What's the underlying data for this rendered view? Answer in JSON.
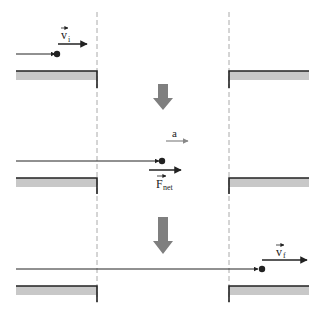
{
  "diagram": {
    "stages": [
      {
        "id": "initial",
        "velocity_label": "v",
        "velocity_subscript": "i"
      },
      {
        "id": "middle",
        "accel_label": "a",
        "force_label": "F",
        "force_subscript": "net"
      },
      {
        "id": "final",
        "velocity_label": "v",
        "velocity_subscript": "f"
      }
    ],
    "colors": {
      "line": "#222222",
      "ledge_fill": "#c8c8c8",
      "dashed": "#aaaaaa",
      "arrow_gray": "#7f7f7f",
      "accel_arrow": "#888888"
    }
  }
}
